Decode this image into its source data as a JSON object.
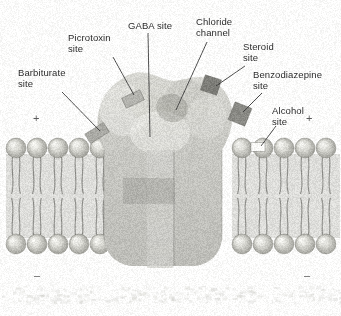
{
  "figure": {
    "background_color": "#fdfdfc",
    "ink_color": "#2b2b2b",
    "membrane_color": "#b9b9b4",
    "protein_color": "#c7c7c2",
    "binding_block_color": "#8f8f8a"
  },
  "labels": [
    {
      "id": "barbiturate",
      "text": "Barbiturate\nsite",
      "x": 18,
      "y": 68,
      "align": "left"
    },
    {
      "id": "picrotoxin",
      "text": "Picrotoxin\nsite",
      "x": 68,
      "y": 33,
      "align": "left"
    },
    {
      "id": "gaba",
      "text": "GABA site",
      "x": 128,
      "y": 21,
      "align": "left"
    },
    {
      "id": "chloride",
      "text": "Chloride\nchannel",
      "x": 196,
      "y": 17,
      "align": "left"
    },
    {
      "id": "steroid",
      "text": "Steroid\nsite",
      "x": 243,
      "y": 42,
      "align": "left"
    },
    {
      "id": "benzodiazepine",
      "text": "Benzodiazepine\nsite",
      "x": 253,
      "y": 70,
      "align": "left"
    },
    {
      "id": "alcohol",
      "text": "Alcohol\nsite",
      "x": 272,
      "y": 106,
      "align": "left"
    }
  ],
  "charge_signs": [
    {
      "id": "plus-left",
      "symbol": "+",
      "x": 33,
      "y": 113
    },
    {
      "id": "plus-right",
      "symbol": "+",
      "x": 306,
      "y": 113
    },
    {
      "id": "minus-left",
      "symbol": "–",
      "x": 34,
      "y": 270
    },
    {
      "id": "minus-right",
      "symbol": "–",
      "x": 304,
      "y": 270
    }
  ],
  "leader_lines": [
    {
      "id": "barbiturate-leader",
      "x1": 62,
      "y1": 92,
      "x2": 100,
      "y2": 131
    },
    {
      "id": "picrotoxin-leader",
      "x1": 113,
      "y1": 57,
      "x2": 134,
      "y2": 95
    },
    {
      "id": "gaba-leader",
      "x1": 148,
      "y1": 33,
      "x2": 150,
      "y2": 137
    },
    {
      "id": "chloride-leader",
      "x1": 207,
      "y1": 42,
      "x2": 176,
      "y2": 110
    },
    {
      "id": "steroid-leader",
      "x1": 245,
      "y1": 66,
      "x2": 216,
      "y2": 86
    },
    {
      "id": "benzodiazepine-leader",
      "x1": 262,
      "y1": 93,
      "x2": 243,
      "y2": 112
    },
    {
      "id": "alcohol-leader",
      "x1": 276,
      "y1": 126,
      "x2": 261,
      "y2": 146
    }
  ],
  "binding_blocks": [
    {
      "id": "barbiturate-block",
      "cx": 97,
      "cy": 133,
      "w": 22,
      "h": 11,
      "rot": -32,
      "shade": "#a9a9a4"
    },
    {
      "id": "picrotoxin-block",
      "cx": 133,
      "cy": 99,
      "w": 20,
      "h": 11,
      "rot": -25,
      "shade": "#b4b4af"
    },
    {
      "id": "steroid-block",
      "cx": 211,
      "cy": 85,
      "w": 17,
      "h": 16,
      "rot": 18,
      "shade": "#7e7e79"
    },
    {
      "id": "benzodiazepine-block",
      "cx": 240,
      "cy": 114,
      "w": 18,
      "h": 19,
      "rot": 22,
      "shade": "#8a8a85"
    },
    {
      "id": "alcohol-block",
      "cx": 258,
      "cy": 147,
      "w": 14,
      "h": 9,
      "rot": 0,
      "shade": "#fbfbf8"
    }
  ],
  "structure": {
    "membrane_top_y": 148,
    "membrane_bottom_y": 244,
    "receptor_dome_cx": 163,
    "receptor_dome_cy": 148,
    "receptor_dome_rx": 85,
    "receptor_dome_ry": 68,
    "pore_x": 160,
    "pore_width": 26,
    "lipid_head_radius": 10,
    "lipid_spacing": 21
  }
}
